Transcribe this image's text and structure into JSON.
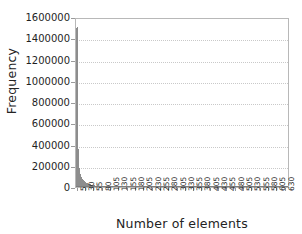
{
  "chart_data": {
    "type": "bar",
    "title": "",
    "xlabel": "Number of elements",
    "ylabel": "Frequency",
    "ylim": [
      0,
      1600000
    ],
    "xlim": [
      0,
      643
    ],
    "grid": true,
    "legend": false,
    "bar_color": "#8d8d8d",
    "frame_color": "#b8b8b8",
    "grid_color": "#c9c9c9",
    "background": "#ffffff",
    "ytick_labels": [
      "1600000",
      "1400000",
      "1200000",
      "1000000",
      "800000",
      "600000",
      "400000",
      "200000",
      "0"
    ],
    "ytick_values": [
      1600000,
      1400000,
      1200000,
      1000000,
      800000,
      600000,
      400000,
      200000,
      0
    ],
    "xtick_labels": [
      "5",
      "30",
      "55",
      "80",
      "105",
      "130",
      "155",
      "180",
      "205",
      "230",
      "255",
      "280",
      "305",
      "330",
      "355",
      "380",
      "405",
      "430",
      "455",
      "480",
      "505",
      "530",
      "555",
      "580",
      "605",
      "630"
    ],
    "xtick_values": [
      5,
      30,
      55,
      80,
      105,
      130,
      155,
      180,
      205,
      230,
      255,
      280,
      305,
      330,
      355,
      380,
      405,
      430,
      455,
      480,
      505,
      530,
      555,
      580,
      605,
      630
    ],
    "categories": [
      3,
      5,
      8,
      11,
      14,
      17,
      20,
      23,
      26,
      29,
      32,
      35,
      38,
      41,
      44,
      47,
      50,
      55,
      60,
      65,
      70,
      75,
      80,
      90,
      100,
      110,
      120,
      130,
      140,
      150,
      165,
      180,
      195,
      210,
      225,
      240,
      255,
      270,
      285,
      300,
      320,
      340,
      360,
      380,
      400,
      420,
      440,
      460,
      480,
      500,
      520,
      540,
      560,
      580,
      600,
      620,
      635
    ],
    "values": [
      1500000,
      1510000,
      360000,
      175000,
      120000,
      95000,
      78000,
      64000,
      54000,
      46000,
      40000,
      35000,
      31000,
      27000,
      24000,
      21000,
      19000,
      16000,
      14000,
      12000,
      10500,
      9200,
      8200,
      7000,
      6000,
      5200,
      4600,
      4100,
      3700,
      3300,
      2900,
      2500,
      2200,
      2000,
      1800,
      1600,
      1450,
      1300,
      1200,
      1100,
      980,
      900,
      820,
      760,
      700,
      650,
      600,
      560,
      520,
      490,
      460,
      430,
      410,
      390,
      370,
      350,
      330
    ]
  },
  "axes": {
    "ylabel_text": "Frequency",
    "xlabel_text": "Number of elements"
  }
}
